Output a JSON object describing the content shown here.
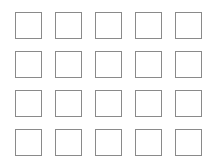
{
  "grid": {
    "rows": 4,
    "columns": 5,
    "cell_size": 27,
    "col_x": [
      15,
      55,
      95,
      135,
      175
    ],
    "row_y": [
      12,
      51,
      90,
      129
    ],
    "border_color": "#8a8a8a",
    "cells": [
      [
        {
          "label": ""
        },
        {
          "label": ""
        },
        {
          "label": ""
        },
        {
          "label": ""
        },
        {
          "label": ""
        }
      ],
      [
        {
          "label": ""
        },
        {
          "label": ""
        },
        {
          "label": ""
        },
        {
          "label": ""
        },
        {
          "label": ""
        }
      ],
      [
        {
          "label": ""
        },
        {
          "label": ""
        },
        {
          "label": ""
        },
        {
          "label": ""
        },
        {
          "label": ""
        }
      ],
      [
        {
          "label": ""
        },
        {
          "label": ""
        },
        {
          "label": ""
        },
        {
          "label": ""
        },
        {
          "label": ""
        }
      ]
    ]
  }
}
